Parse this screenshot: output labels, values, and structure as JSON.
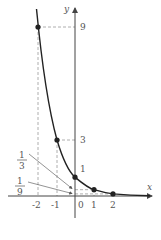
{
  "figure": {
    "function": "y = (1/3)^x",
    "axes": {
      "x_label": "x",
      "y_label": "y",
      "origin_label": "0"
    },
    "x_ticks": [
      "-2",
      "-1",
      "1",
      "2"
    ],
    "y_ticks": [
      "9",
      "3",
      "1"
    ],
    "fraction_labels": [
      {
        "numerator": "1",
        "denominator": "3"
      },
      {
        "numerator": "1",
        "denominator": "9"
      }
    ],
    "points": [
      {
        "x": -2,
        "y": 9
      },
      {
        "x": -1,
        "y": 3
      },
      {
        "x": 0,
        "y": 1
      },
      {
        "x": 1,
        "y": 0.3333
      },
      {
        "x": 2,
        "y": 0.1111
      }
    ],
    "colors": {
      "curve": "#222222",
      "axis": "#444444",
      "guide": "#888888",
      "text": "#555555"
    }
  }
}
